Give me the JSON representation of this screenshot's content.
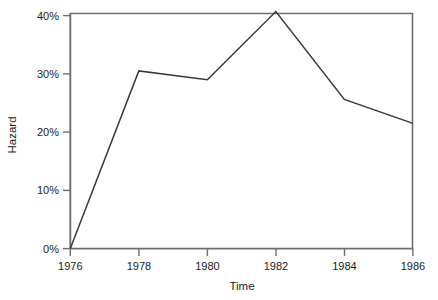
{
  "chart_data": {
    "type": "line",
    "title": "",
    "xlabel": "Time",
    "ylabel": "Hazard",
    "x": [
      1976,
      1978,
      1980,
      1982,
      1984,
      1986
    ],
    "values": [
      0,
      30.5,
      29,
      40.7,
      25.6,
      21.5
    ],
    "series": [
      {
        "name": "Hazard",
        "values": [
          0,
          30.5,
          29,
          40.7,
          25.6,
          21.5
        ]
      }
    ],
    "xtick_labels": [
      "1976",
      "1978",
      "1980",
      "1982",
      "1984",
      "1986"
    ],
    "ytick_labels": [
      "0%",
      "10%",
      "20%",
      "30%",
      "40%"
    ],
    "ytick_values": [
      0,
      10,
      20,
      30,
      40
    ],
    "xlim": [
      1976,
      1986
    ],
    "ylim": [
      0,
      40.7
    ],
    "grid": false,
    "legend": false,
    "legend_position": "none",
    "line_color": "#3a3a3a",
    "axis_color": "#6e6e6e",
    "text_color": "#1a1a1a",
    "background": "#ffffff"
  },
  "axes": {
    "y_title": "Hazard",
    "x_title": "Time"
  }
}
